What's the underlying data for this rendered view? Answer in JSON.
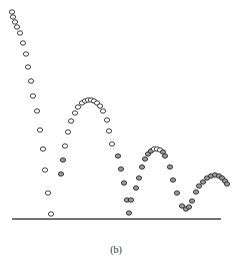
{
  "figure": {
    "caption": "(b)",
    "colors": {
      "ink": "#2a2a2a",
      "floor": "#444444",
      "background": "#ffffff"
    },
    "floor": {
      "x1": 12,
      "x2": 221,
      "y": 219
    },
    "trajectories": [
      {
        "name": "initial-drop",
        "points": [
          [
            12,
            12
          ],
          [
            13,
            17
          ],
          [
            15,
            22
          ],
          [
            17,
            27
          ],
          [
            20,
            33
          ],
          [
            23,
            43
          ],
          [
            26,
            54
          ],
          [
            28,
            67
          ],
          [
            31,
            81
          ],
          [
            33,
            96
          ],
          [
            37,
            111
          ],
          [
            40,
            130
          ],
          [
            43,
            149
          ],
          [
            45,
            170
          ],
          [
            48,
            193
          ],
          [
            51,
            214
          ]
        ]
      },
      {
        "name": "bounce-1",
        "points": [
          [
            61,
            174
          ],
          [
            63,
            160
          ],
          [
            65,
            146
          ],
          [
            68,
            132
          ],
          [
            71,
            121
          ],
          [
            75,
            113
          ],
          [
            78,
            107
          ],
          [
            82,
            103
          ],
          [
            85,
            101
          ],
          [
            88,
            100
          ],
          [
            91,
            100
          ],
          [
            94,
            101
          ],
          [
            97,
            103
          ],
          [
            100,
            106
          ],
          [
            103,
            111
          ],
          [
            107,
            120
          ],
          [
            109,
            131
          ],
          [
            112,
            144
          ],
          [
            118,
            156
          ],
          [
            121,
            169
          ],
          [
            124,
            183
          ],
          [
            127,
            200
          ],
          [
            129,
            213
          ]
        ]
      },
      {
        "name": "bounce-2",
        "points": [
          [
            131,
            200
          ],
          [
            136,
            188
          ],
          [
            139,
            178
          ],
          [
            142,
            167
          ],
          [
            145,
            159
          ],
          [
            148,
            154
          ],
          [
            151,
            151
          ],
          [
            154,
            149
          ],
          [
            157,
            149
          ],
          [
            160,
            150
          ],
          [
            163,
            152
          ],
          [
            165,
            156
          ],
          [
            170,
            167
          ],
          [
            173,
            180
          ],
          [
            177,
            193
          ],
          [
            182,
            206
          ],
          [
            186,
            209
          ]
        ]
      },
      {
        "name": "bounce-3",
        "points": [
          [
            189,
            207
          ],
          [
            192,
            201
          ],
          [
            196,
            192
          ],
          [
            199,
            186
          ],
          [
            203,
            182
          ],
          [
            207,
            178
          ],
          [
            211,
            176
          ],
          [
            215,
            175
          ],
          [
            219,
            176
          ],
          [
            222,
            178
          ],
          [
            225,
            181
          ],
          [
            227,
            184
          ]
        ]
      }
    ]
  }
}
